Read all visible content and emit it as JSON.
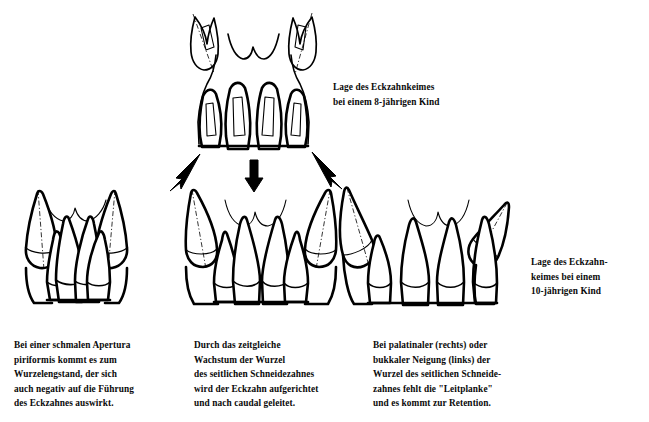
{
  "figure": {
    "language": "de",
    "background_color": "#ffffff",
    "line_color": "#000000"
  },
  "labels": {
    "top_right": "Lage des Eckzahnkeimes\nbei einem 8-jährigen Kind",
    "middle_right": "Lage des Eckzahn-\nkeimes bei einem\n10-jährigen Kind"
  },
  "captions": {
    "left": "Bei einer schmalen Apertura\npiriformis kommt es zum\nWurzelengstand, der sich\nauch negativ auf die Führung\ndes Eckzahnes auswirkt.",
    "middle": "Durch das zeitgleiche\nWachstum der Wurzel\ndes seitlichen Schneidezahnes\nwird der Eckzahn aufgerichtet\nund nach caudal geleitet.",
    "right": "Bei palatinaler (rechts) oder\nbukkaler Neigung (links) der\nWurzel des seitlichen Schneide-\nzahnes fehlt die \"Leitplanke\"\nund es kommt zur Retention."
  },
  "panels": [
    {
      "id": "top",
      "name": "eckzahnkeim-8-jahre",
      "description": "Oberkiefer Frontzahnregion eines 8-jährigen Kindes mit hoch liegenden Eckzahnkeimen"
    },
    {
      "id": "bottom-left",
      "name": "schmale-apertura-piriformis",
      "description": "Wurzelengstand bei schmaler Apertura piriformis"
    },
    {
      "id": "bottom-middle",
      "name": "regelrechte-eckzahnfuehrung",
      "description": "Eckzahn wird durch Wurzelwachstum des seitlichen Schneidezahnes aufgerichtet"
    },
    {
      "id": "bottom-right",
      "name": "eckzahnretention",
      "description": "Palatinale oder bukkale Neigung der Wurzel - fehlende Leitplanke, Retention"
    }
  ],
  "arrows": [
    {
      "name": "arrow-to-left-panel",
      "direction": "down-left"
    },
    {
      "name": "arrow-to-middle-panel",
      "direction": "down"
    },
    {
      "name": "arrow-to-right-panel",
      "direction": "down-right"
    }
  ]
}
